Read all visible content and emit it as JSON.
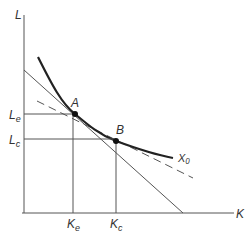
{
  "diagram": {
    "type": "isoquant-isocost",
    "axes": {
      "y_label": "L",
      "x_label": "K"
    },
    "curve_label": "X₀",
    "points": [
      {
        "name": "A",
        "label": "A"
      },
      {
        "name": "B",
        "label": "B"
      }
    ],
    "y_ticks": [
      {
        "label_main": "L",
        "label_sub": "e"
      },
      {
        "label_main": "L",
        "label_sub": "c"
      }
    ],
    "x_ticks": [
      {
        "label_main": "K",
        "label_sub": "e"
      },
      {
        "label_main": "K",
        "label_sub": "c"
      }
    ],
    "colors": {
      "line": "#555555",
      "curve": "#222222",
      "point": "#111111"
    }
  }
}
